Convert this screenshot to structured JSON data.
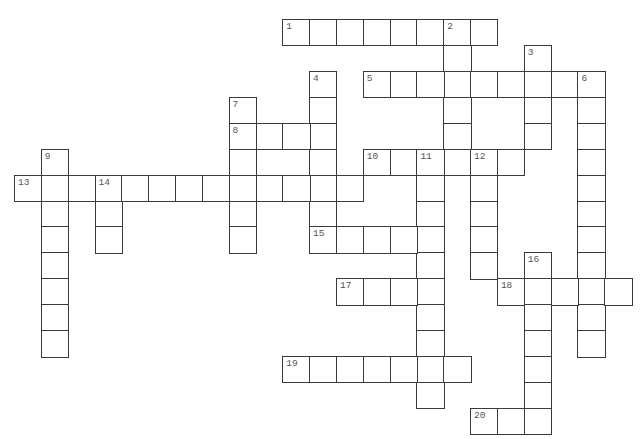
{
  "puzzle": {
    "type": "crossword",
    "grid": {
      "origin_x": 14,
      "origin_y": 19,
      "cell_w": 26.83,
      "cell_h": 25.93
    },
    "words": [
      {
        "number": "1",
        "direction": "across",
        "col": 10,
        "row": 0,
        "length": 8
      },
      {
        "number": "2",
        "direction": "down",
        "col": 16,
        "row": 0,
        "length": 6
      },
      {
        "number": "3",
        "direction": "down",
        "col": 19,
        "row": 1,
        "length": 4
      },
      {
        "number": "4",
        "direction": "down",
        "col": 11,
        "row": 2,
        "length": 7
      },
      {
        "number": "5",
        "direction": "across",
        "col": 13,
        "row": 2,
        "length": 9
      },
      {
        "number": "6",
        "direction": "down",
        "col": 21,
        "row": 2,
        "length": 11
      },
      {
        "number": "7",
        "direction": "down",
        "col": 8,
        "row": 3,
        "length": 6
      },
      {
        "number": "8",
        "direction": "across",
        "col": 8,
        "row": 4,
        "length": 4
      },
      {
        "number": "9",
        "direction": "down",
        "col": 1,
        "row": 5,
        "length": 8
      },
      {
        "number": "10",
        "direction": "across",
        "col": 13,
        "row": 5,
        "length": 6
      },
      {
        "number": "11",
        "direction": "down",
        "col": 15,
        "row": 5,
        "length": 10
      },
      {
        "number": "12",
        "direction": "down",
        "col": 17,
        "row": 5,
        "length": 5
      },
      {
        "number": "13",
        "direction": "across",
        "col": 0,
        "row": 6,
        "length": 13
      },
      {
        "number": "14",
        "direction": "down",
        "col": 3,
        "row": 6,
        "length": 3
      },
      {
        "number": "15",
        "direction": "across",
        "col": 11,
        "row": 8,
        "length": 5
      },
      {
        "number": "16",
        "direction": "down",
        "col": 19,
        "row": 9,
        "length": 7
      },
      {
        "number": "17",
        "direction": "across",
        "col": 12,
        "row": 10,
        "length": 4
      },
      {
        "number": "18",
        "direction": "across",
        "col": 18,
        "row": 10,
        "length": 5
      },
      {
        "number": "19",
        "direction": "across",
        "col": 10,
        "row": 13,
        "length": 7
      },
      {
        "number": "20",
        "direction": "across",
        "col": 17,
        "row": 15,
        "length": 3
      }
    ]
  }
}
